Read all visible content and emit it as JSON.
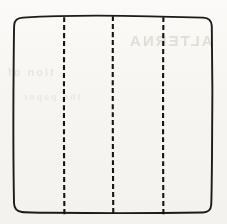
{
  "figure": {
    "name": "square-divided-into-four-vertical-strips",
    "caption": "",
    "background_color": "#f7f6f3",
    "ink_color": "#1b1b1b",
    "canvas": {
      "width": 227,
      "height": 224
    }
  },
  "sheet": {
    "label": "sheet-outline",
    "shape": "square",
    "corner_style": "rounded",
    "corner_radius": 9,
    "stroke_color": "#1b1b1b",
    "stroke_width": 1.9,
    "fill": "none",
    "bounds": {
      "left": 14,
      "top": 17,
      "right": 212,
      "bottom": 212
    },
    "width": 198,
    "height": 195
  },
  "fold_lines": {
    "label": "vertical-dashed-fold-lines",
    "count": 3,
    "orientation": "vertical",
    "style": "dashed",
    "stroke_color": "#141414",
    "stroke_width": 2.1,
    "dash": 5,
    "gap": 3,
    "items": [
      {
        "name": "fold-line-1",
        "x": 64,
        "y_start": 17,
        "y_end": 215
      },
      {
        "name": "fold-line-2",
        "x": 113,
        "y_start": 16,
        "y_end": 215
      },
      {
        "name": "fold-line-3",
        "x": 163,
        "y_start": 17,
        "y_end": 215
      }
    ]
  },
  "panels": {
    "label": "resulting-strips",
    "count": 4,
    "items": [
      {
        "name": "panel-1",
        "x": 14,
        "width": 50
      },
      {
        "name": "panel-2",
        "x": 64,
        "width": 49
      },
      {
        "name": "panel-3",
        "x": 113,
        "width": 50
      },
      {
        "name": "panel-4",
        "x": 163,
        "width": 49
      }
    ]
  },
  "show_through": {
    "label": "faint-reverse-side-bleed-through",
    "visible": true,
    "items": [
      {
        "name": "bleed-upper-right",
        "text": "ALTERNA"
      },
      {
        "name": "bleed-mid-left",
        "text": "tion of"
      },
      {
        "name": "bleed-lower",
        "text": "the paper"
      }
    ]
  }
}
